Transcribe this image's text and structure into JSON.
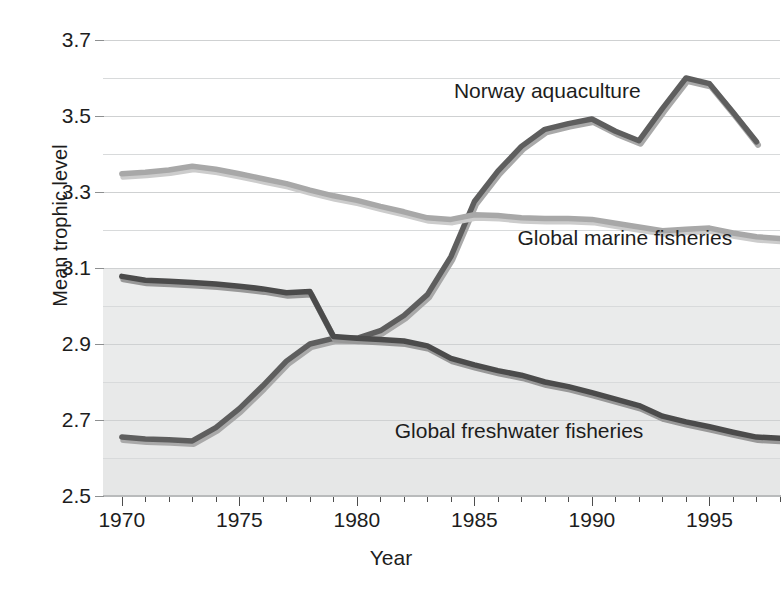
{
  "chart_data": {
    "type": "line",
    "title": "",
    "xlabel": "Year",
    "ylabel": "Mean trophic level",
    "xlim": [
      1969.2,
      1998.0
    ],
    "ylim": [
      2.5,
      3.7
    ],
    "xticks_major": [
      1970,
      1975,
      1980,
      1985,
      1990,
      1995
    ],
    "xtick_labels": [
      "1970",
      "1975",
      "1980",
      "1985",
      "1990",
      "1995"
    ],
    "xtick_minor_step": 1,
    "yticks": [
      2.5,
      2.7,
      2.9,
      3.1,
      3.3,
      3.5,
      3.7
    ],
    "ytick_labels": [
      "2.5",
      "2.7",
      "2.9",
      "3.1",
      "3.3",
      "3.5",
      "3.7"
    ],
    "yticks_minor": [
      2.6,
      2.8,
      3.0,
      3.2,
      3.4,
      3.6
    ],
    "grid": "horizontal",
    "legend": "inline-annotations",
    "series": [
      {
        "name": "Norway aquaculture",
        "color": "#5e5e5e",
        "shadow_color": "#a9a9a9",
        "label_x": 1988.1,
        "label_y": 3.565,
        "x": [
          1970,
          1971,
          1972,
          1973,
          1974,
          1975,
          1976,
          1977,
          1978,
          1979,
          1980,
          1981,
          1982,
          1983,
          1984,
          1985,
          1986,
          1987,
          1988,
          1989,
          1990,
          1991,
          1992,
          1993,
          1994,
          1995,
          1996,
          1997
        ],
        "y": [
          2.655,
          2.65,
          2.648,
          2.645,
          2.68,
          2.73,
          2.79,
          2.855,
          2.9,
          2.915,
          2.915,
          2.935,
          2.975,
          3.03,
          3.13,
          3.275,
          3.355,
          3.42,
          3.465,
          3.48,
          3.492,
          3.46,
          3.435,
          3.52,
          3.6,
          3.585,
          3.51,
          3.432
        ]
      },
      {
        "name": "Global marine fisheries",
        "color": "#a8a8a8",
        "shadow_color": "#cccccc",
        "label_x": 1991.4,
        "label_y": 3.178,
        "x": [
          1970,
          1971,
          1972,
          1973,
          1974,
          1975,
          1976,
          1977,
          1978,
          1979,
          1980,
          1981,
          1982,
          1983,
          1984,
          1985,
          1986,
          1987,
          1988,
          1989,
          1990,
          1991,
          1992,
          1993,
          1994,
          1995,
          1996,
          1997,
          1998
        ],
        "y": [
          3.348,
          3.352,
          3.358,
          3.368,
          3.36,
          3.348,
          3.335,
          3.322,
          3.305,
          3.29,
          3.278,
          3.262,
          3.248,
          3.232,
          3.228,
          3.24,
          3.238,
          3.232,
          3.23,
          3.23,
          3.228,
          3.218,
          3.208,
          3.198,
          3.202,
          3.205,
          3.192,
          3.182,
          3.178
        ]
      },
      {
        "name": "Global freshwater fisheries",
        "color": "#4b4b4b",
        "shadow_color": "#989898",
        "label_x": 1986.9,
        "label_y": 2.672,
        "x": [
          1970,
          1971,
          1972,
          1973,
          1974,
          1975,
          1976,
          1977,
          1978,
          1979,
          1980,
          1981,
          1982,
          1983,
          1984,
          1985,
          1986,
          1987,
          1988,
          1989,
          1990,
          1991,
          1992,
          1993,
          1994,
          1995,
          1996,
          1997,
          1998
        ],
        "y": [
          3.078,
          3.068,
          3.065,
          3.062,
          3.058,
          3.052,
          3.045,
          3.035,
          3.038,
          2.92,
          2.915,
          2.912,
          2.908,
          2.895,
          2.862,
          2.845,
          2.83,
          2.818,
          2.8,
          2.788,
          2.772,
          2.755,
          2.738,
          2.71,
          2.695,
          2.682,
          2.668,
          2.655,
          2.652
        ]
      }
    ]
  }
}
